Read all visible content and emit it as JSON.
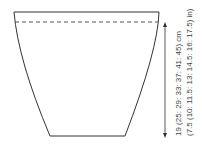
{
  "diagram": {
    "type": "knitting-schematic",
    "shape": "tapered-piece",
    "colors": {
      "outline": "#333333",
      "dashed": "#555555",
      "text": "#444444"
    },
    "measurement": {
      "cm_label": "19 (25: 29: 33: 37: 41: 45) cm",
      "in_label": "(7.5 (10: 11.5: 13: 14.5: 16: 17.5) in)"
    }
  }
}
